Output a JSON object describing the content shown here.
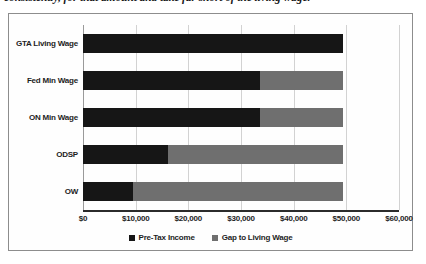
{
  "page": {
    "clipped_heading": "consistently, for that amount and take far short of the living wage."
  },
  "legend": {
    "position": "bottom-center",
    "items": [
      {
        "label": "Pre-Tax Income",
        "color": "#161616",
        "swatch": "square-swatch-income"
      },
      {
        "label": "Gap to Living Wage",
        "color": "#6f6f6f",
        "swatch": "square-swatch-gap"
      }
    ]
  },
  "chart_data": {
    "type": "bar",
    "orientation": "horizontal",
    "stacked": true,
    "title": "",
    "subtitle": "",
    "xlabel": "",
    "ylabel": "",
    "xlim": [
      0,
      60000
    ],
    "xticks": [
      0,
      10000,
      20000,
      30000,
      40000,
      50000,
      60000
    ],
    "xtick_labels": [
      "$0",
      "$10,000",
      "$20,000",
      "$30,000",
      "$40,000",
      "$50,000",
      "$60,000"
    ],
    "grid": "vertical",
    "categories": [
      "GTA Living Wage",
      "Fed Min Wage",
      "ON Min Wage",
      "ODSP",
      "OW"
    ],
    "series": [
      {
        "name": "Pre-Tax Income",
        "color": "#161616",
        "values": [
          49300,
          33700,
          33700,
          16200,
          9400
        ]
      },
      {
        "name": "Gap to Living Wage",
        "color": "#6f6f6f",
        "values": [
          0,
          15600,
          15600,
          33100,
          39900
        ]
      }
    ],
    "totals": [
      49300,
      49300,
      49300,
      49300,
      49300
    ]
  }
}
